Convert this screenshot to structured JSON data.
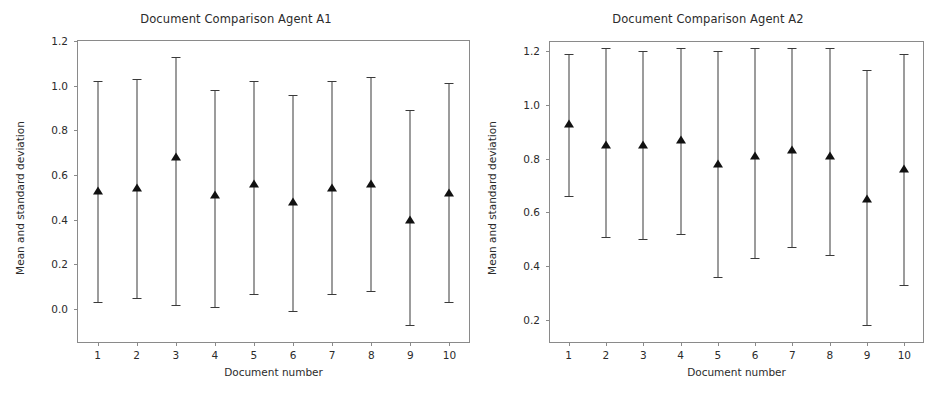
{
  "figure": {
    "background": "#ffffff",
    "marker_color": "#111111",
    "errorbar_color": "#3a3a3a",
    "axis_color": "#8a8a8a"
  },
  "panels": [
    {
      "id": "agent-a1",
      "title": "Document Comparison Agent A1",
      "xlabel": "Document number",
      "ylabel": "Mean and standard deviation",
      "ytick_labels": [
        "1.2",
        "1.0",
        "0.8",
        "0.6",
        "0.4",
        "0.2",
        "0.0"
      ],
      "xtick_labels": [
        "1",
        "2",
        "3",
        "4",
        "5",
        "6",
        "7",
        "8",
        "9",
        "10"
      ]
    },
    {
      "id": "agent-a2",
      "title": "Document Comparison Agent A2",
      "xlabel": "Document number",
      "ylabel": "Mean and standard deviation",
      "ytick_labels": [
        "1.2",
        "1.0",
        "0.8",
        "0.6",
        "0.4",
        "0.2"
      ],
      "xtick_labels": [
        "1",
        "2",
        "3",
        "4",
        "5",
        "6",
        "7",
        "8",
        "9",
        "10"
      ]
    }
  ],
  "chart_data": [
    {
      "type": "scatter",
      "title": "Document Comparison Agent A1",
      "xlabel": "Document number",
      "ylabel": "Mean and standard deviation",
      "categories": [
        "1",
        "2",
        "3",
        "4",
        "5",
        "6",
        "7",
        "8",
        "9",
        "10"
      ],
      "x": [
        1,
        2,
        3,
        4,
        5,
        6,
        7,
        8,
        9,
        10
      ],
      "means": [
        0.53,
        0.54,
        0.68,
        0.51,
        0.56,
        0.48,
        0.54,
        0.56,
        0.4,
        0.52
      ],
      "err_low": [
        0.03,
        0.05,
        0.02,
        0.01,
        0.07,
        -0.01,
        0.07,
        0.08,
        -0.07,
        0.03
      ],
      "err_high": [
        1.02,
        1.03,
        1.13,
        0.98,
        1.02,
        0.96,
        1.02,
        1.04,
        0.89,
        1.01
      ],
      "std": [
        0.5,
        0.49,
        0.46,
        0.49,
        0.48,
        0.49,
        0.47,
        0.48,
        0.48,
        0.49
      ],
      "ylim": [
        -0.147,
        1.2
      ],
      "xlim": [
        0.5,
        10.5
      ],
      "yticks": [
        0.0,
        0.2,
        0.4,
        0.6,
        0.8,
        1.0,
        1.2
      ],
      "ytick_labels": [
        "0.0",
        "0.2",
        "0.4",
        "0.6",
        "0.8",
        "1.0",
        "1.2"
      ],
      "grid": false,
      "legend": null,
      "marker": "triangle-up"
    },
    {
      "type": "scatter",
      "title": "Document Comparison Agent A2",
      "xlabel": "Document number",
      "ylabel": "Mean and standard deviation",
      "categories": [
        "1",
        "2",
        "3",
        "4",
        "5",
        "6",
        "7",
        "8",
        "9",
        "10"
      ],
      "x": [
        1,
        2,
        3,
        4,
        5,
        6,
        7,
        8,
        9,
        10
      ],
      "means": [
        0.93,
        0.85,
        0.85,
        0.87,
        0.78,
        0.81,
        0.83,
        0.81,
        0.65,
        0.76
      ],
      "err_low": [
        0.66,
        0.51,
        0.5,
        0.52,
        0.36,
        0.43,
        0.47,
        0.44,
        0.18,
        0.33
      ],
      "err_high": [
        1.19,
        1.21,
        1.2,
        1.21,
        1.2,
        1.21,
        1.21,
        1.21,
        1.13,
        1.19
      ],
      "std": [
        0.27,
        0.35,
        0.35,
        0.35,
        0.42,
        0.39,
        0.37,
        0.38,
        0.48,
        0.43
      ],
      "ylim": [
        0.118,
        1.233
      ],
      "xlim": [
        0.5,
        10.5
      ],
      "yticks": [
        0.2,
        0.4,
        0.6,
        0.8,
        1.0,
        1.2
      ],
      "ytick_labels": [
        "0.2",
        "0.4",
        "0.6",
        "0.8",
        "1.0",
        "1.2"
      ],
      "grid": false,
      "legend": null,
      "marker": "triangle-up"
    }
  ]
}
